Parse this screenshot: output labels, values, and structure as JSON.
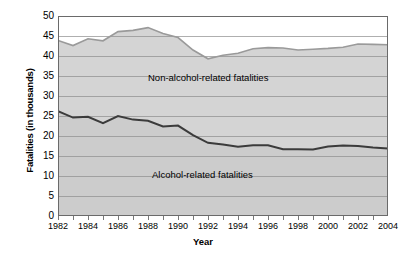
{
  "chart_data": {
    "type": "area",
    "title": "",
    "xlabel": "Year",
    "ylabel": "Fatalities (in thousands)",
    "xlim": [
      1982,
      2004
    ],
    "ylim": [
      0,
      50
    ],
    "ytick_step": 5,
    "xtick_step": 2,
    "grid": true,
    "legend_position": "inline-annotation",
    "x": [
      1982,
      1983,
      1984,
      1985,
      1986,
      1987,
      1988,
      1989,
      1990,
      1991,
      1992,
      1993,
      1994,
      1995,
      1996,
      1997,
      1998,
      1999,
      2000,
      2001,
      2002,
      2003,
      2004
    ],
    "yticks": [
      0,
      5,
      10,
      15,
      20,
      25,
      30,
      35,
      40,
      45,
      50
    ],
    "xticks": [
      1982,
      1984,
      1986,
      1988,
      1990,
      1992,
      1994,
      1996,
      1998,
      2000,
      2002,
      2004
    ],
    "series": [
      {
        "name": "Alcohol-related fatalities",
        "stack": "lower",
        "color": "#3b3b3b",
        "fill": "#cccccc",
        "values": [
          26.2,
          24.6,
          24.8,
          23.2,
          25.0,
          24.1,
          23.8,
          22.4,
          22.6,
          20.2,
          18.3,
          17.9,
          17.3,
          17.7,
          17.7,
          16.7,
          16.7,
          16.6,
          17.4,
          17.6,
          17.5,
          17.1,
          16.9
        ]
      },
      {
        "name": "Non-alcohol-related fatalities",
        "stack": "total",
        "color": "#9a9a9a",
        "fill": "#d4d4d4",
        "values": [
          43.9,
          42.6,
          44.3,
          43.8,
          46.1,
          46.4,
          47.1,
          45.6,
          44.6,
          41.5,
          39.3,
          40.2,
          40.7,
          41.8,
          42.1,
          42.0,
          41.5,
          41.7,
          41.9,
          42.2,
          43.0,
          42.9,
          42.8
        ]
      }
    ],
    "annotations": [
      {
        "text": "Non-alcohol-related fatalities",
        "x": 1990,
        "y": 33
      },
      {
        "text": "Alcohol-related fatalities",
        "x": 1990,
        "y": 13
      }
    ]
  },
  "axes": {
    "y_title": "Fatalities (in thousands)",
    "x_title": "Year"
  }
}
